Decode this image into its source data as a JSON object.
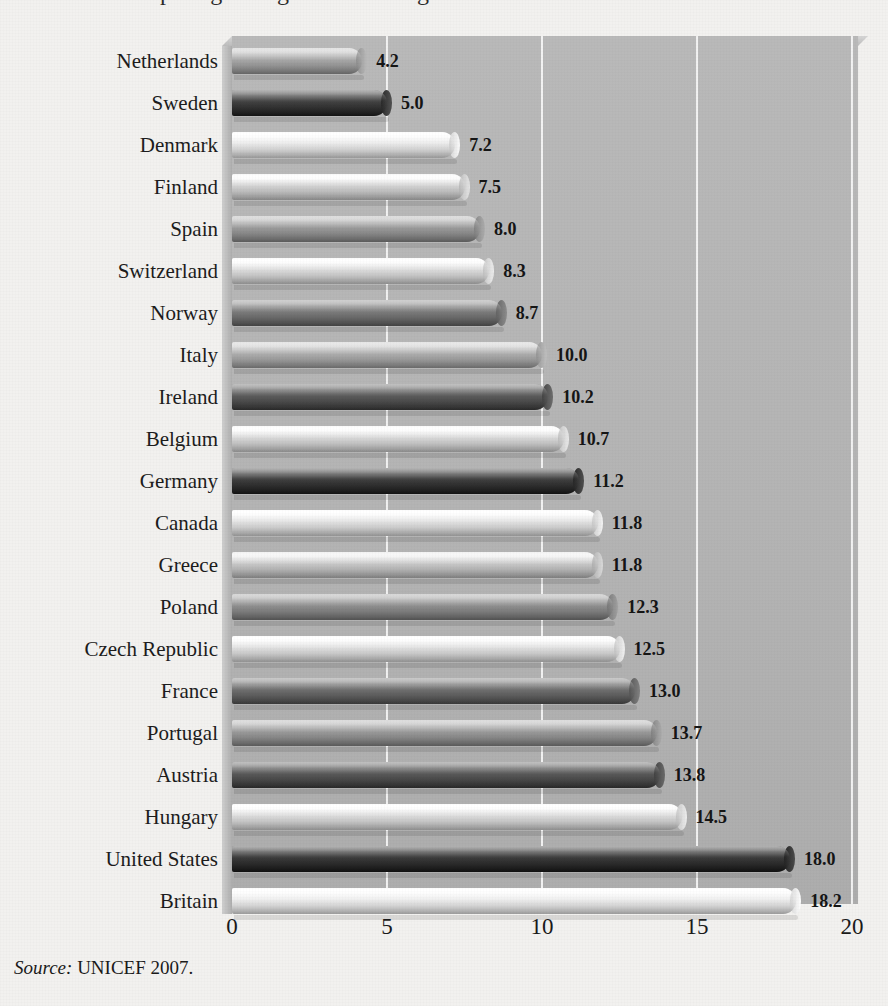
{
  "figure": {
    "title_partial": "comparing a range of wellbeing measures across rich countries",
    "source_prefix": "Source:",
    "source_text": "UNICEF 2007."
  },
  "chart_data": {
    "type": "bar",
    "orientation": "horizontal",
    "title": "",
    "xlabel": "",
    "ylabel": "",
    "xlim": [
      0,
      20
    ],
    "xticks": [
      "0",
      "5",
      "10",
      "15",
      "20"
    ],
    "xtick_values": [
      0,
      5,
      10,
      15,
      20
    ],
    "grid": true,
    "legend": null,
    "categories": [
      "Netherlands",
      "Sweden",
      "Denmark",
      "Finland",
      "Spain",
      "Switzerland",
      "Norway",
      "Italy",
      "Ireland",
      "Belgium",
      "Germany",
      "Canada",
      "Greece",
      "Poland",
      "Czech Republic",
      "France",
      "Portugal",
      "Austria",
      "Hungary",
      "United States",
      "Britain"
    ],
    "values": [
      4.2,
      5.0,
      7.2,
      7.5,
      8.0,
      8.3,
      8.7,
      10.0,
      10.2,
      10.7,
      11.2,
      11.8,
      11.8,
      12.3,
      12.5,
      13.0,
      13.7,
      13.8,
      14.5,
      18.0,
      18.2
    ],
    "value_labels": [
      "4.2",
      "5.0",
      "7.2",
      "7.5",
      "8.0",
      "8.3",
      "8.7",
      "10.0",
      "10.2",
      "10.7",
      "11.2",
      "11.8",
      "11.8",
      "12.3",
      "12.5",
      "13.0",
      "13.7",
      "13.8",
      "14.5",
      "18.0",
      "18.2"
    ],
    "bar_colors": [
      "#a8a8a8",
      "#404040",
      "#e9e9e9",
      "#d3d3d3",
      "#9b9b9b",
      "#dcdcdc",
      "#7b7b7b",
      "#aeaeae",
      "#5b5b5b",
      "#d8d8d8",
      "#3d3d3d",
      "#e2e2e2",
      "#c8c8c8",
      "#8f8f8f",
      "#e0e0e0",
      "#6e6e6e",
      "#9a9a9a",
      "#595959",
      "#dcdcdc",
      "#3a3a3a",
      "#ededed"
    ]
  },
  "palette": {
    "page_background": "#f2f1ef",
    "plot_background": "#b4b4b4",
    "gridline": "#f4f4f4",
    "text": "#1a1a1a"
  }
}
